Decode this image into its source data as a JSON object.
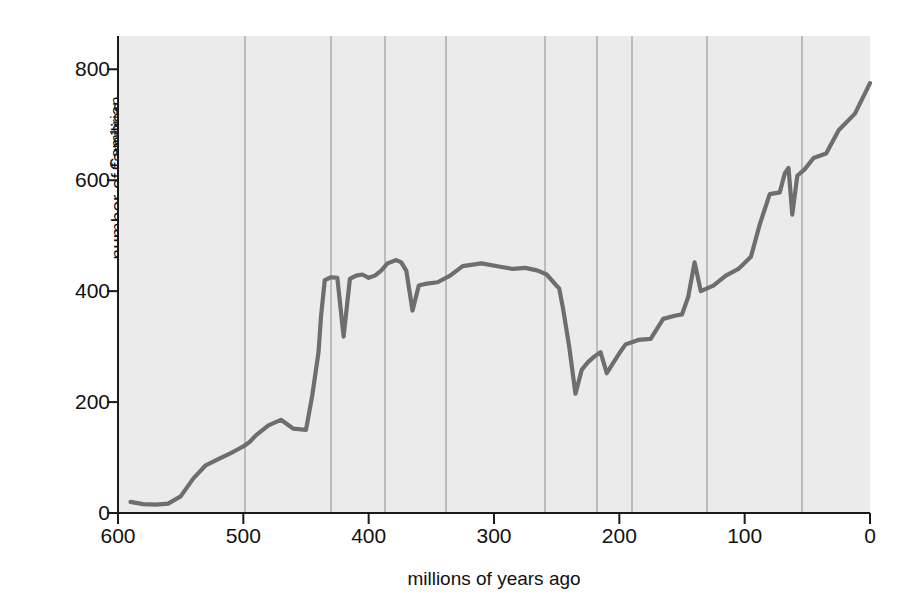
{
  "chart_data": {
    "type": "line",
    "title": "",
    "xlabel": "millions of years ago",
    "ylabel": "number of families",
    "xlim": [
      600,
      0
    ],
    "ylim": [
      0,
      860
    ],
    "xticks": [
      600,
      500,
      400,
      300,
      200,
      100,
      0
    ],
    "yticks": [
      0,
      200,
      400,
      600,
      800
    ],
    "x_axis_reversed": true,
    "grid": false,
    "legend": null,
    "plot_background": "#ebebeb",
    "line_color": "#6e6e6e",
    "axis_color": "#1a1a1a",
    "period_line_color": "#8c8c8c",
    "series": [
      {
        "name": "marine animal families",
        "x": [
          590,
          580,
          570,
          560,
          550,
          540,
          530,
          520,
          510,
          505,
          500,
          495,
          490,
          480,
          470,
          460,
          450,
          445,
          440,
          438,
          435,
          430,
          425,
          420,
          415,
          410,
          405,
          400,
          395,
          390,
          385,
          378,
          374,
          370,
          365,
          360,
          355,
          345,
          335,
          325,
          310,
          295,
          285,
          275,
          265,
          258,
          251,
          248,
          245,
          240,
          235,
          230,
          225,
          220,
          215,
          210,
          205,
          200,
          195,
          190,
          185,
          175,
          165,
          155,
          150,
          145,
          140,
          135,
          125,
          115,
          105,
          95,
          88,
          80,
          72,
          68,
          65,
          62,
          58,
          52,
          45,
          35,
          25,
          12,
          0
        ],
        "y": [
          20,
          16,
          15,
          17,
          30,
          62,
          86,
          97,
          108,
          114,
          120,
          128,
          140,
          158,
          168,
          152,
          150,
          212,
          290,
          355,
          420,
          425,
          424,
          318,
          422,
          428,
          430,
          424,
          428,
          437,
          450,
          456,
          452,
          437,
          365,
          410,
          413,
          416,
          428,
          445,
          450,
          444,
          440,
          442,
          437,
          430,
          412,
          405,
          370,
          300,
          215,
          258,
          272,
          282,
          290,
          252,
          270,
          288,
          304,
          308,
          312,
          314,
          350,
          356,
          358,
          390,
          452,
          400,
          410,
          428,
          440,
          462,
          520,
          575,
          578,
          612,
          622,
          538,
          608,
          620,
          640,
          648,
          690,
          720,
          775
        ]
      }
    ],
    "annotations": [
      {
        "label": "*",
        "x_px": 337,
        "y_px": 272,
        "meaning": "end-Ordovician mass extinction"
      },
      {
        "label": "*",
        "x_px": 430,
        "y_px": 265,
        "meaning": "Late Devonian mass extinction"
      },
      {
        "label": "*",
        "x_px": 594,
        "y_px": 344,
        "meaning": "end-Permian mass extinction"
      },
      {
        "label": "*",
        "x_px": 629,
        "y_px": 338,
        "meaning": "end-Triassic mass extinction"
      },
      {
        "label": "*",
        "x_px": 795,
        "y_px": 167,
        "meaning": "end-Cretaceous mass extinction"
      }
    ],
    "periods": [
      {
        "name": "Cambrian",
        "start_ma": 600,
        "end_ma": 505,
        "boundary_px": 118,
        "label_x_px": 127,
        "label_bottom_px": 150
      },
      {
        "name": "Ordovician",
        "start_ma": 505,
        "end_ma": 438,
        "boundary_px": 245,
        "label_x_px": 254,
        "label_bottom_px": 160
      },
      {
        "name": "Silurian",
        "start_ma": 438,
        "end_ma": 408,
        "boundary_px": 331,
        "label_x_px": 340,
        "label_bottom_px": 145
      },
      {
        "name": "Devonian",
        "start_ma": 408,
        "end_ma": 360,
        "boundary_px": 385,
        "label_x_px": 394,
        "label_bottom_px": 150
      },
      {
        "name": "Carboniferous",
        "start_ma": 360,
        "end_ma": 286,
        "boundary_px": 446,
        "label_x_px": 455,
        "label_bottom_px": 185
      },
      {
        "name": "Permian",
        "start_ma": 286,
        "end_ma": 248,
        "boundary_px": 545,
        "label_x_px": 554,
        "label_bottom_px": 145
      },
      {
        "name": "Triassic",
        "start_ma": 248,
        "end_ma": 213,
        "boundary_px": 597,
        "label_x_px": 606,
        "label_bottom_px": 140
      },
      {
        "name": "Jurassic",
        "start_ma": 213,
        "end_ma": 144,
        "boundary_px": 632,
        "label_x_px": 641,
        "label_bottom_px": 142
      },
      {
        "name": "Cretaceous",
        "start_ma": 144,
        "end_ma": 65,
        "boundary_px": 707,
        "label_x_px": 716,
        "label_bottom_px": 168
      },
      {
        "name": "Tertiary",
        "start_ma": 65,
        "end_ma": 0,
        "boundary_px": 802,
        "label_x_px": 811,
        "label_bottom_px": 140
      }
    ]
  }
}
